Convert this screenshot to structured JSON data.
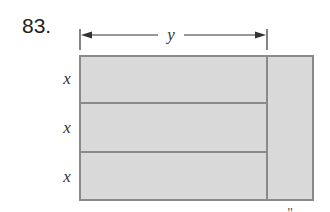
{
  "problem": {
    "number": "83."
  },
  "diagram": {
    "top_dimension_label": "y",
    "row_labels": [
      "x",
      "x",
      "x"
    ],
    "bottom_partial_label": "\""
  },
  "colors": {
    "fill": "#d9d9d9",
    "border": "#8a8a8a",
    "line": "#333333"
  }
}
